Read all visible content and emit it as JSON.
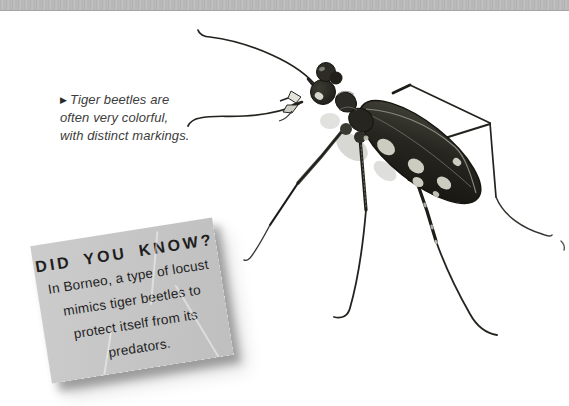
{
  "theme": {
    "page_bg": "#ffffff",
    "top_bar_color": "#b8b8b8",
    "caption_color": "#3c3c3c",
    "paper_color": "#c6c6c6",
    "note_text_color": "#1e1e1e",
    "beetle_body_color": "#26251f",
    "beetle_spot_color": "#cdccc1"
  },
  "caption": {
    "marker": "▶",
    "lines": [
      "Tiger beetles are",
      "often very colorful,",
      "with distinct markings."
    ]
  },
  "did_you_know": {
    "title": "DID YOU KNOW?",
    "lines": [
      "In Borneo, a type of locust",
      "mimics tiger beetles to",
      "protect itself from its",
      "predators."
    ]
  },
  "photo": {
    "subject": "tiger beetle with cream spots, long antennae and legs"
  }
}
